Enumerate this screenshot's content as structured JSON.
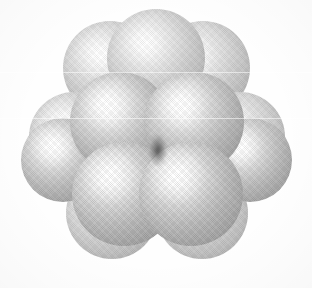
{
  "figure": {
    "kind": "space-filling-sphere-cluster",
    "caption": "",
    "background_color": "#fefefe",
    "sphere_base_color": "#c2c2c2",
    "sphere_highlight_color": "#ffffff",
    "sphere_shadow_color": "#9a9a9a",
    "crevice_color": "#3c3c3c",
    "canvas": {
      "width": 312,
      "height": 288
    }
  },
  "chart_data": {
    "type": "scatter",
    "subtitle": "",
    "xlabel": "",
    "ylabel": "",
    "xlim": [
      0,
      312
    ],
    "ylim": [
      0,
      288
    ],
    "grid": false,
    "legend": "none",
    "spheres": [
      {
        "id": "back-top-left",
        "cx": 110,
        "cy": 68,
        "r": 47,
        "tier": "back",
        "z": 1
      },
      {
        "id": "back-top-center",
        "cx": 156,
        "cy": 58,
        "r": 49,
        "tier": "back",
        "z": 2
      },
      {
        "id": "back-top-right",
        "cx": 203,
        "cy": 68,
        "r": 47,
        "tier": "back",
        "z": 1
      },
      {
        "id": "back-left",
        "cx": 74,
        "cy": 137,
        "r": 45,
        "tier": "back",
        "z": 1
      },
      {
        "id": "back-right",
        "cx": 240,
        "cy": 137,
        "r": 45,
        "tier": "back",
        "z": 1
      },
      {
        "id": "back-bottom-left",
        "cx": 112,
        "cy": 213,
        "r": 46,
        "tier": "back",
        "z": 1
      },
      {
        "id": "back-bottom-right",
        "cx": 202,
        "cy": 213,
        "r": 46,
        "tier": "back",
        "z": 1
      },
      {
        "id": "mid-left",
        "cx": 120,
        "cy": 122,
        "r": 50,
        "tier": "mid",
        "z": 4
      },
      {
        "id": "mid-right",
        "cx": 194,
        "cy": 122,
        "r": 50,
        "tier": "mid",
        "z": 4
      },
      {
        "id": "mid-far-left",
        "cx": 63,
        "cy": 160,
        "r": 42,
        "tier": "mid",
        "z": 3
      },
      {
        "id": "mid-far-right",
        "cx": 250,
        "cy": 160,
        "r": 42,
        "tier": "mid",
        "z": 3
      },
      {
        "id": "front-left",
        "cx": 124,
        "cy": 194,
        "r": 52,
        "tier": "front",
        "z": 6
      },
      {
        "id": "front-right",
        "cx": 191,
        "cy": 194,
        "r": 52,
        "tier": "front",
        "z": 6
      }
    ],
    "crevices": [
      {
        "id": "center-contact",
        "cx": 158,
        "cy": 150,
        "rx": 9,
        "ry": 16
      }
    ],
    "scan_bands": [
      {
        "y": 72
      },
      {
        "y": 118
      }
    ],
    "counts": {
      "total_spheres": 13,
      "back_layer": 7,
      "mid_layer": 4,
      "front_layer": 2
    }
  }
}
